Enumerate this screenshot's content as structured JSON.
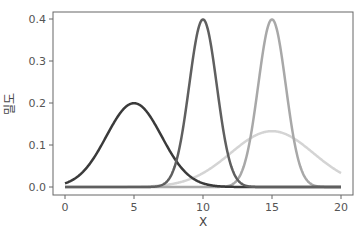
{
  "chart_data": {
    "type": "line",
    "title": "",
    "xlabel": "X",
    "ylabel": "밀도",
    "xlim": [
      0,
      20
    ],
    "ylim": [
      0,
      0.4
    ],
    "x_ticks": [
      0,
      5,
      10,
      15,
      20
    ],
    "x_tick_labels": [
      "0",
      "5",
      "10",
      "15",
      "20"
    ],
    "y_ticks": [
      0.0,
      0.1,
      0.2,
      0.3,
      0.4
    ],
    "y_tick_labels": [
      "0.0",
      "0.1",
      "0.2",
      "0.3",
      "0.4"
    ],
    "grid": false,
    "legend": null,
    "series": [
      {
        "name": "N(5, 2)",
        "mean": 5,
        "sd": 2,
        "peak": 0.199,
        "color": "#3a3a3a"
      },
      {
        "name": "N(10, 1)",
        "mean": 10,
        "sd": 1,
        "peak": 0.399,
        "color": "#5f5f5f"
      },
      {
        "name": "N(15, 1)",
        "mean": 15,
        "sd": 1,
        "peak": 0.399,
        "color": "#a8a8a8"
      },
      {
        "name": "N(15, 3)",
        "mean": 15,
        "sd": 3,
        "peak": 0.133,
        "color": "#d4d4d4"
      }
    ]
  }
}
